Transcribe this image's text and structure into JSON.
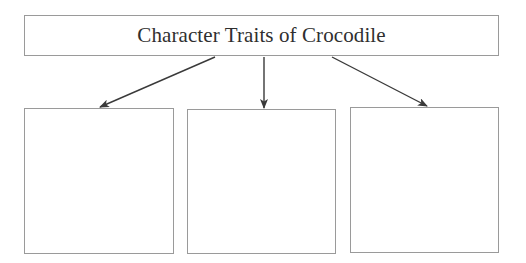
{
  "diagram": {
    "title": "Character Traits of Crocodile",
    "boxes": [
      {
        "label": ""
      },
      {
        "label": ""
      },
      {
        "label": ""
      }
    ],
    "colors": {
      "border": "#9a9a9a",
      "arrow": "#3a3a3a",
      "text": "#2f2f2f"
    }
  }
}
